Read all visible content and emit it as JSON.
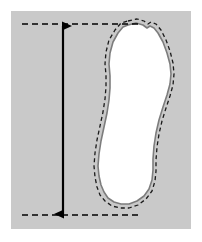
{
  "figure": {
    "title": "Foot length measurement diagram",
    "description": "Outline of a right footprint on a gray panel with a vertical double-headed arrow indicating foot length between dashed reference lines at the toe and the heel.",
    "canvas": {
      "width": 202,
      "height": 242
    },
    "background_color": "#ffffff"
  },
  "panel": {
    "name": "gray-measurement-panel",
    "fill_color": "#c9c9c9",
    "x": 11,
    "y": 11,
    "width": 180,
    "height": 218
  },
  "footprint": {
    "label": "footprint-outline",
    "fill_color": "#ffffff",
    "outline_color": "#7d7d7d",
    "outline_width": 1.6,
    "dashed_outline_color": "#1a1a1a",
    "dashed_outline_width": 1.3,
    "dash_pattern": "4,3",
    "dash_offset_px": 3.5,
    "outline_points": "128,25 136,23 143,25 147,28 150,26 154,28 158,33 163,42 167,53 170,64 171,74 170,84 167,95 163,107 159,120 156,133 154,146 153,159 153,170 152,180 149,189 144,196 137,201 129,204 121,204 114,202 108,198 104,192 101,185 99,176 98,166 99,154 101,141 104,127 107,113 109,100 110,88 110,76 109,64 110,53 113,42 118,33 123,27",
    "dashed_points": "128,21 137,19 144,21 148,24 151,22 156,24 161,30 166,40 170,51 173,63 174,74 173,85 170,96 166,108 162,121 159,134 157,147 156,160 156,171 155,181 152,191 146,199 138,205 129,208 120,208 112,206 105,201 100,195 97,187 95,177 94,166 95,153 97,140 100,126 103,112 105,99 106,87 106,75 105,64 106,52 109,40 115,30 121,23"
  },
  "measurement": {
    "name": "foot-length-measure",
    "arrow_color": "#000000",
    "arrow_x": 63,
    "arrow_top_y": 26,
    "arrow_bottom_y": 214,
    "shaft_width": 2.2,
    "arrowhead_width": 13,
    "arrowhead_length": 16,
    "reference_lines": [
      {
        "name": "toe-reference-line",
        "y": 24,
        "x_start": 22,
        "x_end": 140,
        "color": "#000000",
        "dash_pattern": "6,4",
        "width": 1.4
      },
      {
        "name": "heel-reference-line",
        "y": 215,
        "x_start": 22,
        "x_end": 140,
        "color": "#000000",
        "dash_pattern": "6,4",
        "width": 1.4
      }
    ]
  }
}
